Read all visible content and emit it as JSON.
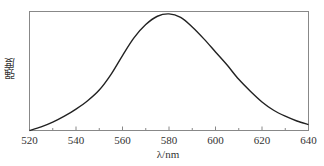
{
  "chart_data": {
    "type": "line",
    "title": "",
    "xlabel": "λ/nm",
    "ylabel": "强度",
    "xlim": [
      520,
      640
    ],
    "ylim": [
      0,
      1
    ],
    "xticks": [
      520,
      540,
      560,
      580,
      600,
      620,
      640
    ],
    "xtick_labels": [
      "520",
      "540",
      "560",
      "580",
      "600",
      "620",
      "640"
    ],
    "grid": false,
    "legend": null,
    "series": [
      {
        "name": "emission spectrum",
        "color": "#222222",
        "x": [
          520,
          525,
          530,
          535,
          540,
          545,
          550,
          555,
          560,
          565,
          570,
          575,
          580,
          585,
          590,
          595,
          600,
          605,
          610,
          615,
          620,
          625,
          630,
          635,
          640
        ],
        "y": [
          0.0,
          0.03,
          0.07,
          0.12,
          0.18,
          0.25,
          0.34,
          0.47,
          0.63,
          0.78,
          0.89,
          0.96,
          0.98,
          0.95,
          0.87,
          0.77,
          0.66,
          0.55,
          0.43,
          0.33,
          0.24,
          0.17,
          0.12,
          0.08,
          0.05
        ]
      }
    ]
  }
}
